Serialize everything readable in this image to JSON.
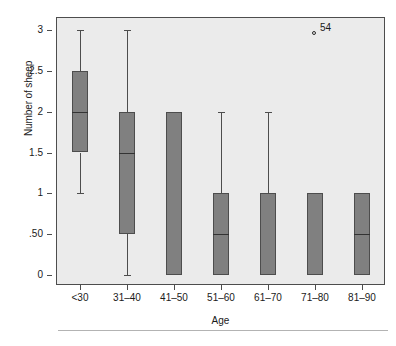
{
  "chart_data": {
    "type": "box",
    "title": "",
    "xlabel": "Age",
    "ylabel": "Number of sheep",
    "categories": [
      "<30",
      "31–40",
      "41–50",
      "51–60",
      "61–70",
      "71–80",
      "81–90"
    ],
    "ylim": [
      0,
      3
    ],
    "yticks": [
      0,
      0.5,
      1,
      1.5,
      2,
      2.5,
      3
    ],
    "ytick_labels": [
      "0",
      ".50",
      "1",
      "1.5",
      "2",
      "2.5",
      "3"
    ],
    "grid": false,
    "legend": "none",
    "box_fill_color": "#808080",
    "box_border_color": "#4d4d4d",
    "plot_background_color": "#ebebeb",
    "boxes": [
      {
        "category": "<30",
        "whisker_low": 1,
        "q1": 1.5,
        "median": 2,
        "q3": 2.5,
        "whisker_high": 3,
        "has_median_line": true,
        "has_low_whisker": true,
        "has_high_whisker": true
      },
      {
        "category": "31–40",
        "whisker_low": 0,
        "q1": 0.5,
        "median": 1.5,
        "q3": 2,
        "whisker_high": 3,
        "has_median_line": true,
        "has_low_whisker": true,
        "has_high_whisker": true
      },
      {
        "category": "41–50",
        "whisker_low": 0,
        "q1": 0,
        "median": 0,
        "q3": 2,
        "whisker_high": 2,
        "has_median_line": false,
        "has_low_whisker": false,
        "has_high_whisker": false
      },
      {
        "category": "51–60",
        "whisker_low": 0,
        "q1": 0,
        "median": 0.5,
        "q3": 1,
        "whisker_high": 2,
        "has_median_line": true,
        "has_low_whisker": false,
        "has_high_whisker": true
      },
      {
        "category": "61–70",
        "whisker_low": 0,
        "q1": 0,
        "median": 0,
        "q3": 1,
        "whisker_high": 2,
        "has_median_line": false,
        "has_low_whisker": false,
        "has_high_whisker": true
      },
      {
        "category": "71–80",
        "whisker_low": 0,
        "q1": 0,
        "median": 0,
        "q3": 1,
        "whisker_high": 1,
        "has_median_line": false,
        "has_low_whisker": false,
        "has_high_whisker": false
      },
      {
        "category": "81–90",
        "whisker_low": 0,
        "q1": 0,
        "median": 0.5,
        "q3": 1,
        "whisker_high": 1,
        "has_median_line": true,
        "has_low_whisker": false,
        "has_high_whisker": false
      }
    ],
    "outliers": [
      {
        "category": "71–80",
        "value": 3,
        "label": "54"
      }
    ]
  }
}
